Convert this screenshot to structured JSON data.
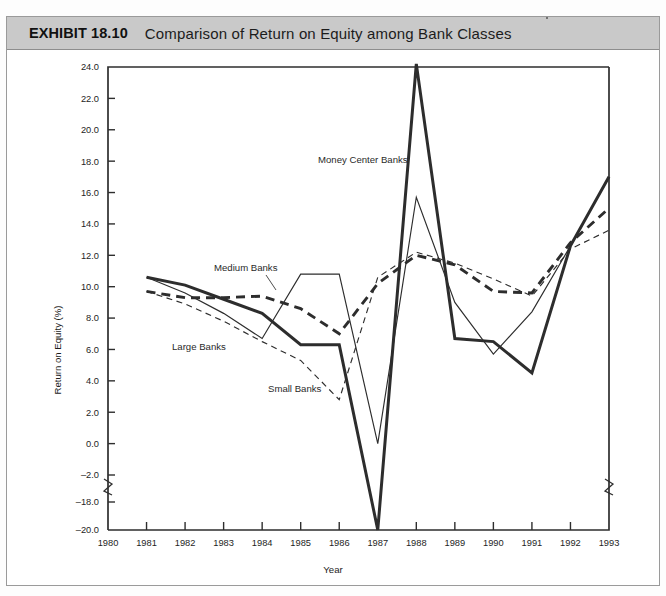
{
  "exhibit": {
    "number_label": "EXHIBIT 18.10",
    "title": "Comparison of Return on Equity among Bank Classes"
  },
  "chart_data": {
    "type": "line",
    "title": "Comparison of Return on Equity among Bank Classes",
    "xlabel": "Year",
    "ylabel": "Return on Equity (%)",
    "x": [
      1981,
      1982,
      1983,
      1984,
      1985,
      1986,
      1987,
      1988,
      1989,
      1990,
      1991,
      1992,
      1993
    ],
    "xlim": [
      1980,
      1993
    ],
    "xticks": [
      "1980",
      "1981",
      "1982",
      "1983",
      "1984",
      "1985",
      "1986",
      "1987",
      "1988",
      "1989",
      "1990",
      "1991",
      "1992",
      "1993"
    ],
    "ylim": [
      -20.0,
      24.0
    ],
    "yticks": [
      "24.0",
      "22.0",
      "20.0",
      "18.0",
      "16.0",
      "14.0",
      "12.0",
      "10.0",
      "8.0",
      "6.0",
      "4.0",
      "2.0",
      "0.0",
      "-2.0",
      "-18.0",
      "-20.0"
    ],
    "y_axis_break": {
      "between": [
        "-2.0",
        "-18.0"
      ],
      "shown": true
    },
    "grid": false,
    "legend": "inline-annotations",
    "series": [
      {
        "name": "Money Center Banks",
        "style": "thick-solid",
        "values": [
          10.6,
          10.1,
          9.2,
          8.3,
          6.3,
          6.3,
          -20.0,
          24.2,
          6.7,
          6.5,
          4.5,
          12.6,
          17.0
        ]
      },
      {
        "name": "Large Banks",
        "style": "thin-solid",
        "values": [
          10.6,
          9.6,
          8.3,
          6.7,
          10.8,
          10.8,
          0.0,
          15.7,
          9.0,
          5.7,
          8.4,
          12.6,
          17.0
        ]
      },
      {
        "name": "Medium Banks",
        "style": "thick-dashed",
        "values": [
          9.7,
          9.3,
          9.3,
          9.4,
          8.6,
          7.0,
          10.2,
          12.0,
          11.4,
          9.7,
          9.6,
          12.8,
          15.0
        ]
      },
      {
        "name": "Small Banks",
        "style": "thin-dashed",
        "values": [
          9.7,
          8.9,
          7.8,
          6.5,
          5.3,
          2.8,
          10.6,
          12.2,
          11.5,
          10.5,
          9.4,
          12.4,
          13.6
        ]
      }
    ],
    "annotations": [
      {
        "text": "Money Center Banks",
        "x_px": 318,
        "y_px": 163,
        "leader": false
      },
      {
        "text": "Medium Banks",
        "x_px": 214,
        "y_px": 271,
        "leader": true
      },
      {
        "text": "Large Banks",
        "x_px": 172,
        "y_px": 350,
        "leader": false
      },
      {
        "text": "Small Banks",
        "x_px": 268,
        "y_px": 392,
        "leader": false
      }
    ]
  }
}
